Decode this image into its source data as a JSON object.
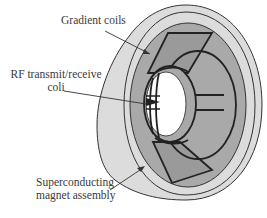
{
  "diagram": {
    "labels": {
      "gradient_coils": "Gradient coils",
      "rf_line1": "RF transmit/receive",
      "rf_line2": "coli",
      "magnet_line1": "Superconducting",
      "magnet_line2": "magnet assembly"
    },
    "colors": {
      "outer_shell": "#dcdcdc",
      "gradient_region": "#a9a9a9",
      "coil_panel": "#9a9a9a",
      "bore": "#ffffff",
      "outline": "#2a2a2a",
      "text": "#3a3a3a"
    }
  }
}
